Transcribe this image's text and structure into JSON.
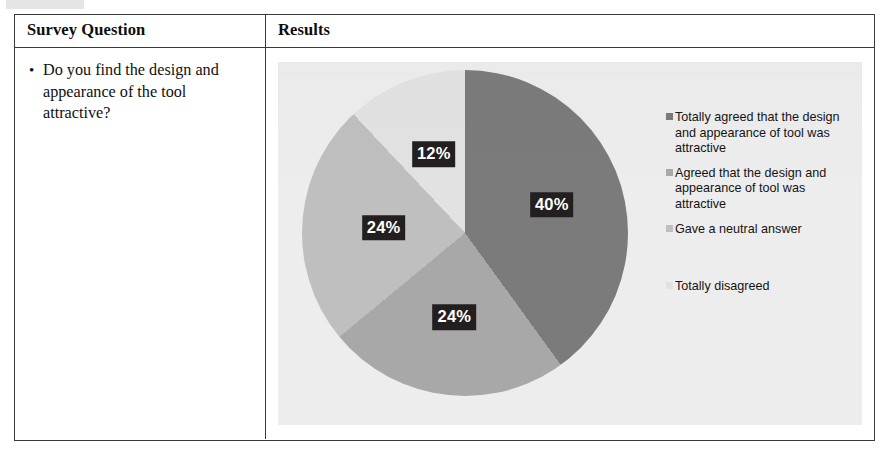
{
  "table": {
    "headers": {
      "question_col": "Survey Question",
      "results_col": "Results"
    },
    "question": {
      "bullet": "•",
      "text": "Do you find the design and appearance of the tool attractive?"
    }
  },
  "chart_data": {
    "type": "pie",
    "title": "",
    "categories": [
      "Totally agreed that the design and appearance of tool was attractive",
      "Agreed that the design and appearance of tool was attractive",
      "Gave a neutral answer",
      "Totally disagreed"
    ],
    "values": [
      40,
      24,
      24,
      12
    ],
    "value_labels": [
      "40%",
      "24%",
      "24%",
      "12%"
    ],
    "colors": [
      "#7b7b7b",
      "#a8a8a8",
      "#bfbfbf",
      "#e2e2e2"
    ],
    "legend_position": "right",
    "grid": false,
    "start_angle_deg": 0,
    "direction": "clockwise",
    "data_label_bg": "#231f20",
    "data_label_color": "#ffffff",
    "plot_background": "#ededed"
  },
  "legend": {
    "items": [
      {
        "label": "Totally agreed that the design and appearance of tool was attractive",
        "color": "#7b7b7b"
      },
      {
        "label": "Agreed that the design and appearance of tool was attractive",
        "color": "#a8a8a8"
      },
      {
        "label": "Gave a neutral answer",
        "color": "#bfbfbf"
      },
      {
        "label": "Totally disagreed",
        "color": "#e2e2e2"
      }
    ]
  }
}
